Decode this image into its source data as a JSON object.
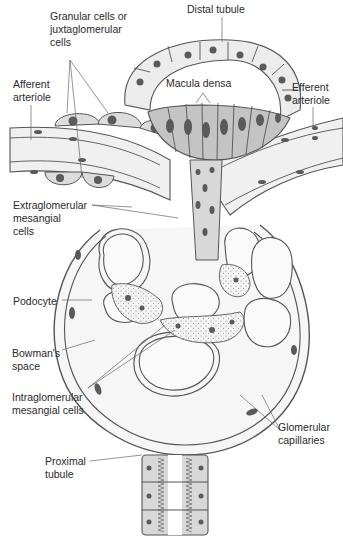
{
  "diagram": {
    "colors": {
      "background": "#ffffff",
      "outline": "#555555",
      "cell_light": "#ececec",
      "cell_mid": "#cfcfcf",
      "cell_dark": "#b8b8b8",
      "nucleus": "#5a5a5a",
      "mesangium": "#f2f2f2",
      "leader_line": "#666666"
    },
    "labels": {
      "granular_cells": "Granular cells or\njuxtaglomerular\ncells",
      "distal_tubule": "Distal tubule",
      "afferent_arteriole": "Afferent\narteriole",
      "macula_densa": "Macula densa",
      "efferent_arteriole": "Efferent\narteriole",
      "extraglomerular_mesangial": "Extraglomerular\nmesangial\ncells",
      "podocyte": "Podocyte",
      "bowmans_space": "Bowman's\nspace",
      "intraglomerular_mesangial": "Intraglomerular\nmesangial cells",
      "glomerular_capillaries": "Glomerular\ncapillaries",
      "proximal_tubule": "Proximal\ntubule"
    }
  }
}
